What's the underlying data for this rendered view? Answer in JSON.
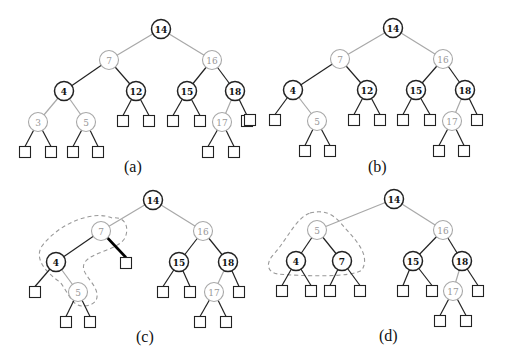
{
  "colors": {
    "black": "#222222",
    "red": "#a8a8a8",
    "dash": "#999999"
  },
  "panels": [
    {
      "caption": "(a)",
      "nodes": [
        {
          "id": "14",
          "x": 161,
          "y": 29,
          "c": "black"
        },
        {
          "id": "7",
          "x": 109,
          "y": 60,
          "c": "red"
        },
        {
          "id": "16",
          "x": 212,
          "y": 60,
          "c": "red"
        },
        {
          "id": "4",
          "x": 64,
          "y": 91,
          "c": "black"
        },
        {
          "id": "12",
          "x": 136,
          "y": 91,
          "c": "black"
        },
        {
          "id": "15",
          "x": 187,
          "y": 91,
          "c": "black"
        },
        {
          "id": "18",
          "x": 235,
          "y": 91,
          "c": "black"
        },
        {
          "id": "3",
          "x": 38,
          "y": 122,
          "c": "red"
        },
        {
          "id": "5",
          "x": 86,
          "y": 122,
          "c": "red"
        },
        {
          "id": "17",
          "x": 222,
          "y": 122,
          "c": "red"
        }
      ],
      "leaves": [
        [
          25,
          152
        ],
        [
          51,
          152
        ],
        [
          73,
          152
        ],
        [
          98,
          152
        ],
        [
          123,
          121
        ],
        [
          149,
          121
        ],
        [
          173,
          121
        ],
        [
          200,
          121
        ],
        [
          247,
          121
        ],
        [
          208,
          152
        ],
        [
          234,
          152
        ]
      ],
      "edges": [
        [
          "14",
          "7",
          "red"
        ],
        [
          "14",
          "16",
          "red"
        ],
        [
          "7",
          "4",
          "black"
        ],
        [
          "7",
          "12",
          "black"
        ],
        [
          "16",
          "15",
          "black"
        ],
        [
          "16",
          "18",
          "black"
        ],
        [
          "4",
          "3",
          "red"
        ],
        [
          "4",
          "5",
          "red"
        ],
        [
          "18",
          "17",
          "red"
        ],
        [
          "3",
          0,
          "black"
        ],
        [
          "3",
          1,
          "black"
        ],
        [
          "5",
          2,
          "black"
        ],
        [
          "5",
          3,
          "black"
        ],
        [
          "12",
          4,
          "black"
        ],
        [
          "12",
          5,
          "black"
        ],
        [
          "15",
          6,
          "black"
        ],
        [
          "15",
          7,
          "black"
        ],
        [
          "18",
          8,
          "black"
        ],
        [
          "17",
          9,
          "black"
        ],
        [
          "17",
          10,
          "black"
        ]
      ],
      "caption_pos": [
        124,
        172
      ],
      "dashed": ""
    },
    {
      "caption": "(b)",
      "nodes": [
        {
          "id": "14",
          "x": 393,
          "y": 28,
          "c": "black"
        },
        {
          "id": "7",
          "x": 340,
          "y": 59,
          "c": "red"
        },
        {
          "id": "16",
          "x": 443,
          "y": 59,
          "c": "red"
        },
        {
          "id": "4",
          "x": 293,
          "y": 90,
          "c": "black"
        },
        {
          "id": "12",
          "x": 367,
          "y": 90,
          "c": "black"
        },
        {
          "id": "15",
          "x": 416,
          "y": 90,
          "c": "black"
        },
        {
          "id": "18",
          "x": 465,
          "y": 90,
          "c": "black"
        },
        {
          "id": "5",
          "x": 317,
          "y": 121,
          "c": "red"
        },
        {
          "id": "17",
          "x": 452,
          "y": 121,
          "c": "red"
        }
      ],
      "leaves": [
        [
          250,
          120
        ],
        [
          275,
          120
        ],
        [
          354,
          120
        ],
        [
          380,
          120
        ],
        [
          403,
          120
        ],
        [
          430,
          120
        ],
        [
          477,
          120
        ],
        [
          305,
          151
        ],
        [
          330,
          151
        ],
        [
          439,
          151
        ],
        [
          464,
          151
        ]
      ],
      "edges": [
        [
          "14",
          "7",
          "red"
        ],
        [
          "14",
          "16",
          "red"
        ],
        [
          "7",
          "4",
          "black"
        ],
        [
          "7",
          "12",
          "black"
        ],
        [
          "16",
          "15",
          "black"
        ],
        [
          "16",
          "18",
          "black"
        ],
        [
          "4",
          "5",
          "red"
        ],
        [
          "18",
          "17",
          "red"
        ],
        [
          "4",
          1,
          "black"
        ],
        [
          "5",
          7,
          "black"
        ],
        [
          "5",
          8,
          "black"
        ],
        [
          "12",
          2,
          "black"
        ],
        [
          "12",
          3,
          "black"
        ],
        [
          "15",
          4,
          "black"
        ],
        [
          "15",
          5,
          "black"
        ],
        [
          "18",
          6,
          "black"
        ],
        [
          "17",
          9,
          "black"
        ],
        [
          "17",
          10,
          "black"
        ]
      ],
      "caption_pos": [
        368,
        172
      ],
      "dashed": ""
    },
    {
      "caption": "(c)",
      "nodes": [
        {
          "id": "14",
          "x": 153,
          "y": 200,
          "c": "black"
        },
        {
          "id": "7",
          "x": 101,
          "y": 231,
          "c": "red"
        },
        {
          "id": "16",
          "x": 203,
          "y": 231,
          "c": "red"
        },
        {
          "id": "4",
          "x": 56,
          "y": 262,
          "c": "black"
        },
        {
          "id": "15",
          "x": 179,
          "y": 262,
          "c": "black"
        },
        {
          "id": "18",
          "x": 228,
          "y": 262,
          "c": "black"
        },
        {
          "id": "5",
          "x": 78,
          "y": 292,
          "c": "red"
        },
        {
          "id": "17",
          "x": 214,
          "y": 292,
          "c": "red"
        }
      ],
      "leaves": [
        [
          126,
          263
        ],
        [
          35,
          292
        ],
        [
          163,
          292
        ],
        [
          190,
          292
        ],
        [
          239,
          292
        ],
        [
          66,
          322
        ],
        [
          90,
          322
        ],
        [
          200,
          322
        ],
        [
          226,
          322
        ]
      ],
      "edges": [
        [
          "14",
          "7",
          "red"
        ],
        [
          "14",
          "16",
          "red"
        ],
        [
          "7",
          "4",
          "black"
        ],
        [
          "16",
          "15",
          "black"
        ],
        [
          "16",
          "18",
          "black"
        ],
        [
          "4",
          "5",
          "red"
        ],
        [
          "18",
          "17",
          "red"
        ],
        [
          "4",
          1,
          "black"
        ],
        [
          "5",
          5,
          "black"
        ],
        [
          "5",
          6,
          "black"
        ],
        [
          "15",
          2,
          "black"
        ],
        [
          "15",
          3,
          "black"
        ],
        [
          "18",
          4,
          "black"
        ],
        [
          "17",
          7,
          "black"
        ],
        [
          "17",
          8,
          "black"
        ]
      ],
      "thick_edge": [
        "7",
        0
      ],
      "caption_pos": [
        136,
        342
      ],
      "dashed": "M 112 218 C 95 210, 60 222, 42 246 C 34 258, 45 272, 60 282 C 68 292, 72 306, 82 306 C 98 306, 100 296, 94 286 C 88 276, 80 270, 85 262 C 92 252, 118 250, 125 238 C 130 226, 124 216, 112 218 Z"
    },
    {
      "caption": "(d)",
      "nodes": [
        {
          "id": "14",
          "x": 394,
          "y": 199,
          "c": "black"
        },
        {
          "id": "5",
          "x": 317,
          "y": 230,
          "c": "red"
        },
        {
          "id": "16",
          "x": 443,
          "y": 230,
          "c": "red"
        },
        {
          "id": "4",
          "x": 296,
          "y": 261,
          "c": "black"
        },
        {
          "id": "7",
          "x": 342,
          "y": 261,
          "c": "black"
        },
        {
          "id": "15",
          "x": 413,
          "y": 261,
          "c": "black"
        },
        {
          "id": "18",
          "x": 462,
          "y": 261,
          "c": "black"
        },
        {
          "id": "17",
          "x": 453,
          "y": 291,
          "c": "red"
        }
      ],
      "leaves": [
        [
          282,
          291
        ],
        [
          311,
          291
        ],
        [
          330,
          291
        ],
        [
          360,
          291
        ],
        [
          403,
          291
        ],
        [
          432,
          291
        ],
        [
          478,
          291
        ],
        [
          440,
          321
        ],
        [
          466,
          321
        ]
      ],
      "edges": [
        [
          "14",
          "5",
          "red"
        ],
        [
          "14",
          "16",
          "red"
        ],
        [
          "5",
          "4",
          "black"
        ],
        [
          "5",
          "7",
          "black"
        ],
        [
          "16",
          "15",
          "black"
        ],
        [
          "16",
          "18",
          "black"
        ],
        [
          "18",
          "17",
          "red"
        ],
        [
          "4",
          0,
          "black"
        ],
        [
          "4",
          1,
          "black"
        ],
        [
          "7",
          2,
          "black"
        ],
        [
          "7",
          3,
          "black"
        ],
        [
          "15",
          4,
          "black"
        ],
        [
          "15",
          5,
          "black"
        ],
        [
          "18",
          6,
          "black"
        ],
        [
          "17",
          7,
          "black"
        ],
        [
          "17",
          8,
          "black"
        ]
      ],
      "caption_pos": [
        379,
        341
      ],
      "dashed": "M 310 213 C 330 208, 338 220, 345 228 C 358 242, 370 256, 362 270 C 352 278, 300 276, 278 274 C 266 272, 266 262, 274 254 C 288 238, 296 218, 310 213 Z"
    }
  ]
}
